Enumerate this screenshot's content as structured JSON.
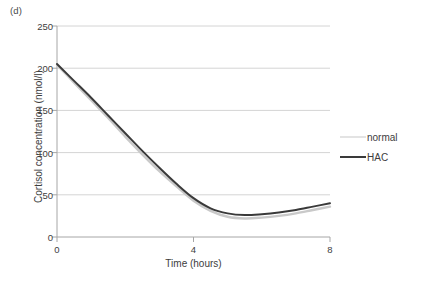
{
  "panel": {
    "label": "(d)"
  },
  "colors": {
    "normal_line": "#c9c9c9",
    "hac_line": "#3a3a3a",
    "gridline": "#d0d0d0",
    "axis": "#9a9a9a",
    "text": "#3d3d3d",
    "background": "#ffffff"
  },
  "legend": {
    "position": "right",
    "entries": [
      {
        "label": "normal",
        "color": "#c9c9c9",
        "width": 1.4
      },
      {
        "label": "HAC",
        "color": "#3a3a3a",
        "width": 2.2
      }
    ]
  },
  "axes": {
    "y_ticks": [
      "250",
      "200",
      "150",
      "100",
      "50",
      "0"
    ],
    "x_ticks": [
      "0",
      "4",
      "8"
    ]
  },
  "chart_data": {
    "type": "line",
    "title": "(d)",
    "xlabel": "Time (hours)",
    "ylabel": "Cortisol concentration (nmol/l)",
    "xlim": [
      0,
      8
    ],
    "ylim": [
      0,
      250
    ],
    "xticks": [
      0,
      4,
      8
    ],
    "yticks": [
      0,
      50,
      100,
      150,
      200,
      250
    ],
    "grid": "horizontal",
    "legend_position": "right",
    "x": [
      0,
      0.5,
      1,
      1.5,
      2,
      2.5,
      3,
      3.5,
      4,
      4.5,
      5,
      5.5,
      6,
      6.5,
      7,
      7.5,
      8
    ],
    "series": [
      {
        "name": "normal",
        "color": "#c9c9c9",
        "values": [
          204,
          183,
          162,
          141,
          119,
          98,
          78,
          60,
          43,
          31,
          24,
          22,
          23,
          25,
          28,
          32,
          36
        ]
      },
      {
        "name": "HAC",
        "color": "#3a3a3a",
        "values": [
          205,
          185,
          165,
          144,
          123,
          102,
          82,
          63,
          46,
          34,
          28,
          26,
          27,
          29,
          32,
          36,
          40
        ]
      }
    ]
  }
}
